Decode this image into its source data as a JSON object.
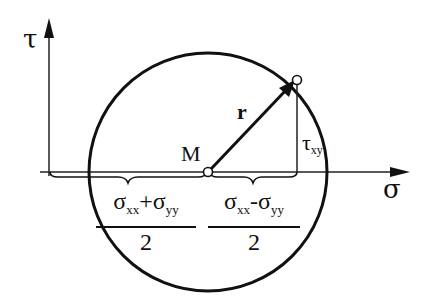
{
  "diagram": {
    "axes": {
      "vertical_label": "τ",
      "horizontal_label": "σ"
    },
    "center_label": "M",
    "radius_label": "r",
    "shear_label": {
      "symbol": "τ",
      "subscript": "xy"
    },
    "center_fraction": {
      "numerator": [
        {
          "symbol": "σ",
          "subscript": "xx"
        },
        {
          "op": "+"
        },
        {
          "symbol": "σ",
          "subscript": "yy"
        }
      ],
      "denominator": "2"
    },
    "half_difference_fraction": {
      "numerator": [
        {
          "symbol": "σ",
          "subscript": "xx"
        },
        {
          "op": "-"
        },
        {
          "symbol": "σ",
          "subscript": "yy"
        }
      ],
      "denominator": "2"
    },
    "colors": {
      "ink": "#111111",
      "background": "#ffffff"
    }
  }
}
